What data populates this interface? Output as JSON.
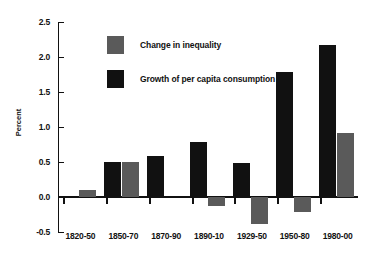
{
  "chart_data": {
    "type": "bar",
    "title": "",
    "xlabel": "",
    "ylabel": "Percent",
    "ylim": [
      -0.5,
      2.5
    ],
    "ytick_labels": [
      "2.5",
      "2.0",
      "1.5",
      "1.0",
      "0.5",
      "0.0",
      "-0.5"
    ],
    "yticks": [
      2.5,
      2.0,
      1.5,
      1.0,
      0.5,
      0.0,
      -0.5
    ],
    "grid": false,
    "legend_position": "upper-left-inside",
    "categories": [
      "1820-50",
      "1850-70",
      "1870-90",
      "1890-10",
      "1929-50",
      "1950-80",
      "1980-00"
    ],
    "series": [
      {
        "name": "Growth of per capita consumption",
        "color": "#111111",
        "values": [
          null,
          0.5,
          0.58,
          0.79,
          0.49,
          1.78,
          2.17
        ]
      },
      {
        "name": "Change in inequality",
        "color": "#5a5a5a",
        "values": [
          0.1,
          0.5,
          null,
          -0.13,
          -0.38,
          -0.22,
          0.92
        ]
      }
    ]
  },
  "legend": {
    "items": [
      {
        "label": "Change in inequality",
        "swatch": "gray"
      },
      {
        "label": "Growth of per capita consumption",
        "swatch": "black"
      }
    ]
  },
  "axes": {
    "y_title": "Percent"
  }
}
